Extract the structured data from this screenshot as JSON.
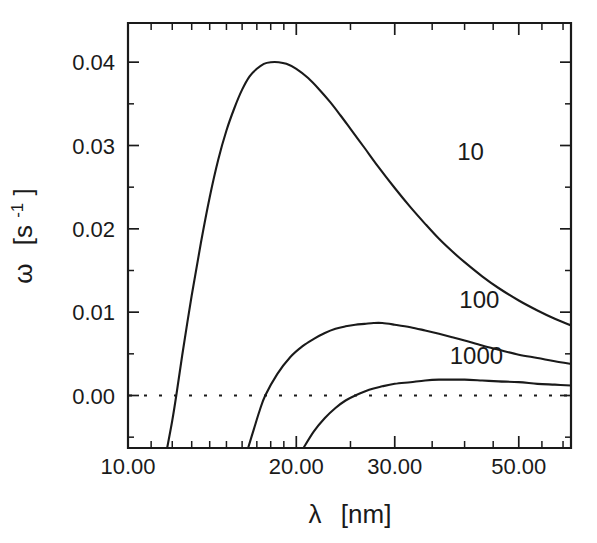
{
  "figure": {
    "background_color": "#ffffff",
    "ink_color": "#1a1a1a"
  },
  "chart_data": {
    "type": "line",
    "title": "",
    "subtitle": "",
    "xlabel": "λ [nm]",
    "xlabel_symbol": "λ",
    "xlabel_unit": "[nm]",
    "ylabel": "ω [s⁻¹]",
    "ylabel_symbol": "ω",
    "ylabel_unit_open": "[s",
    "ylabel_unit_exp": "-1",
    "ylabel_unit_close": "]",
    "xscale": "log",
    "yscale": "linear",
    "xlim": [
      10.0,
      62.0
    ],
    "ylim": [
      -0.0063,
      0.0447
    ],
    "grid": false,
    "legend_position": "inline-curve-labels",
    "xticks_major": [
      10.0,
      20.0,
      30.0,
      50.0
    ],
    "xtick_labels": [
      "10.00",
      "20.00",
      "30.00",
      "50.00"
    ],
    "xticks_minor": [
      11,
      12,
      13,
      14,
      15,
      16,
      17,
      18,
      19,
      25,
      35,
      40,
      45,
      55,
      60
    ],
    "yticks_major": [
      0.0,
      0.01,
      0.02,
      0.03,
      0.04
    ],
    "ytick_labels": [
      "0.00",
      "0.01",
      "0.02",
      "0.03",
      "0.04"
    ],
    "yticks_minor": [
      -0.005,
      0.005,
      0.015,
      0.025,
      0.035
    ],
    "zero_reference_line": {
      "value": 0.0,
      "style": "dotted"
    },
    "series": [
      {
        "name": "10",
        "label": "10",
        "label_at": {
          "x": 41.0,
          "y": 0.0283
        },
        "points": [
          [
            11.75,
            -0.0063
          ],
          [
            12.0,
            -0.003
          ],
          [
            12.2,
            0.0
          ],
          [
            12.5,
            0.0048
          ],
          [
            13.0,
            0.012
          ],
          [
            13.5,
            0.0183
          ],
          [
            14.0,
            0.0238
          ],
          [
            14.5,
            0.0283
          ],
          [
            15.0,
            0.0318
          ],
          [
            15.5,
            0.0345
          ],
          [
            16.0,
            0.0367
          ],
          [
            16.5,
            0.0383
          ],
          [
            17.0,
            0.0392
          ],
          [
            17.5,
            0.0398
          ],
          [
            18.0,
            0.04
          ],
          [
            18.6,
            0.04
          ],
          [
            19.2,
            0.0398
          ],
          [
            20.0,
            0.0392
          ],
          [
            21.0,
            0.0381
          ],
          [
            22.0,
            0.0367
          ],
          [
            23.0,
            0.0352
          ],
          [
            24.0,
            0.0336
          ],
          [
            25.0,
            0.032
          ],
          [
            26.5,
            0.0297
          ],
          [
            28.0,
            0.0275
          ],
          [
            30.0,
            0.0249
          ],
          [
            32.0,
            0.0226
          ],
          [
            34.0,
            0.0206
          ],
          [
            36.0,
            0.0188
          ],
          [
            38.0,
            0.0173
          ],
          [
            40.0,
            0.016
          ],
          [
            43.0,
            0.0143
          ],
          [
            46.0,
            0.0129
          ],
          [
            50.0,
            0.0114
          ],
          [
            54.0,
            0.0102
          ],
          [
            58.0,
            0.0092
          ],
          [
            62.0,
            0.0084
          ]
        ]
      },
      {
        "name": "100",
        "label": "100",
        "label_at": {
          "x": 42.5,
          "y": 0.0105
        },
        "points": [
          [
            16.4,
            -0.0063
          ],
          [
            16.8,
            -0.004
          ],
          [
            17.2,
            -0.0018
          ],
          [
            17.6,
            0.0
          ],
          [
            18.5,
            0.0026
          ],
          [
            19.5,
            0.0046
          ],
          [
            20.5,
            0.0059
          ],
          [
            21.5,
            0.0068
          ],
          [
            22.5,
            0.0075
          ],
          [
            23.5,
            0.008
          ],
          [
            24.5,
            0.0083
          ],
          [
            25.5,
            0.0085
          ],
          [
            26.5,
            0.0086
          ],
          [
            27.5,
            0.0087
          ],
          [
            28.5,
            0.0087
          ],
          [
            30.0,
            0.0085
          ],
          [
            32.0,
            0.0082
          ],
          [
            34.0,
            0.0078
          ],
          [
            36.0,
            0.0074
          ],
          [
            38.0,
            0.007
          ],
          [
            40.0,
            0.0066
          ],
          [
            43.0,
            0.006
          ],
          [
            46.0,
            0.0055
          ],
          [
            50.0,
            0.0049
          ],
          [
            54.0,
            0.0045
          ],
          [
            58.0,
            0.0041
          ],
          [
            62.0,
            0.0038
          ]
        ]
      },
      {
        "name": "1000",
        "label": "1000",
        "label_at": {
          "x": 42.0,
          "y": 0.0038
        },
        "points": [
          [
            20.6,
            -0.0063
          ],
          [
            21.5,
            -0.0043
          ],
          [
            22.5,
            -0.0027
          ],
          [
            23.5,
            -0.0015
          ],
          [
            24.5,
            -0.0006
          ],
          [
            25.5,
            0.0
          ],
          [
            27.0,
            0.0007
          ],
          [
            28.5,
            0.0011
          ],
          [
            30.0,
            0.0014
          ],
          [
            32.0,
            0.0016
          ],
          [
            34.0,
            0.0018
          ],
          [
            36.0,
            0.0019
          ],
          [
            38.0,
            0.0019
          ],
          [
            40.0,
            0.0019
          ],
          [
            43.0,
            0.0018
          ],
          [
            46.0,
            0.0017
          ],
          [
            50.0,
            0.0016
          ],
          [
            54.0,
            0.0014
          ],
          [
            58.0,
            0.0013
          ],
          [
            62.0,
            0.0012
          ]
        ]
      }
    ]
  },
  "plot_box": {
    "left": 128,
    "right": 571,
    "top": 23,
    "bottom": 448
  }
}
